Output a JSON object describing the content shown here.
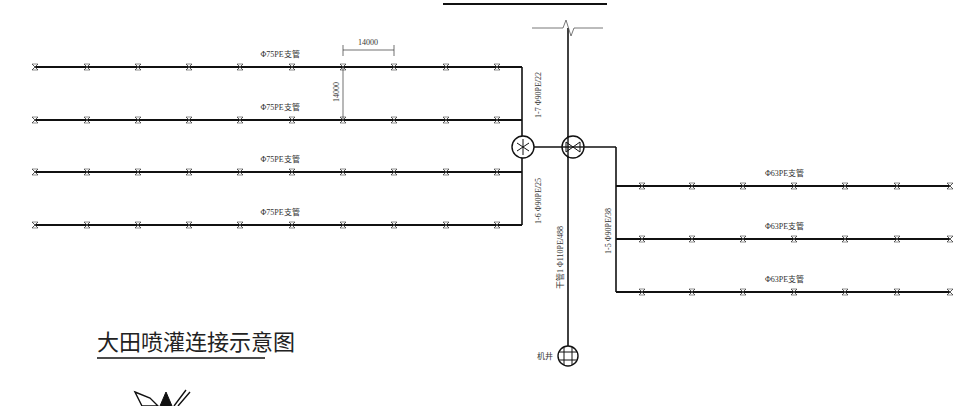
{
  "diagram": {
    "title": "大田喷灌连接示意图",
    "colors": {
      "line": "#111111",
      "text": "#333333",
      "background": "#ffffff"
    },
    "left_branches": {
      "label": "Φ75PE支管",
      "y": [
        67,
        120,
        172,
        225
      ],
      "x_start": 35,
      "x_end": 522,
      "sprinkler_x": [
        35,
        87,
        138,
        189,
        240,
        292,
        343,
        394,
        446,
        497
      ]
    },
    "right_branches": {
      "label": "Φ63PE支管",
      "y": [
        186,
        239,
        292
      ],
      "x_start": 616,
      "x_end": 950,
      "sprinkler_x": [
        642,
        692,
        743,
        794,
        845,
        897,
        950
      ]
    },
    "dimensions": {
      "horizontal": "14000",
      "vertical": "14000"
    },
    "pipe_labels": {
      "left_upper": "1-7  Φ90PE/22",
      "left_lower": "1-6  Φ90PE/25",
      "right": "1-5  Φ90PE/38",
      "main": "干管1  Φ110PE/488"
    },
    "well_label": "机井"
  }
}
